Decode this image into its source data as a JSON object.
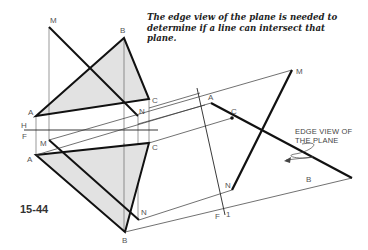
{
  "figure": {
    "number": "15-44",
    "caption_lines": [
      "The edge view of the plane is needed to",
      "determine if a line can intersect that",
      "plane."
    ],
    "annotation": {
      "lines": [
        "EDGE VIEW OF",
        "THE PLANE"
      ]
    }
  },
  "labels": {
    "top_view": {
      "M": "M",
      "B": "B",
      "C": "C",
      "A": "A",
      "N": "N"
    },
    "fold_line_HF": {
      "H": "H",
      "F": "F"
    },
    "front_view": {
      "M": "M",
      "A": "A",
      "C": "C",
      "B": "B",
      "N": "N"
    },
    "aux_view": {
      "A": "A",
      "C": "C",
      "M": "M",
      "N": "N",
      "B": "B"
    },
    "fold_line_F1": {
      "F": "F",
      "one": "1"
    }
  },
  "colors": {
    "plane_fill": "#e2e2e2",
    "heavy_line": "#111111",
    "thin_line": "#333333",
    "label": "#555555"
  }
}
